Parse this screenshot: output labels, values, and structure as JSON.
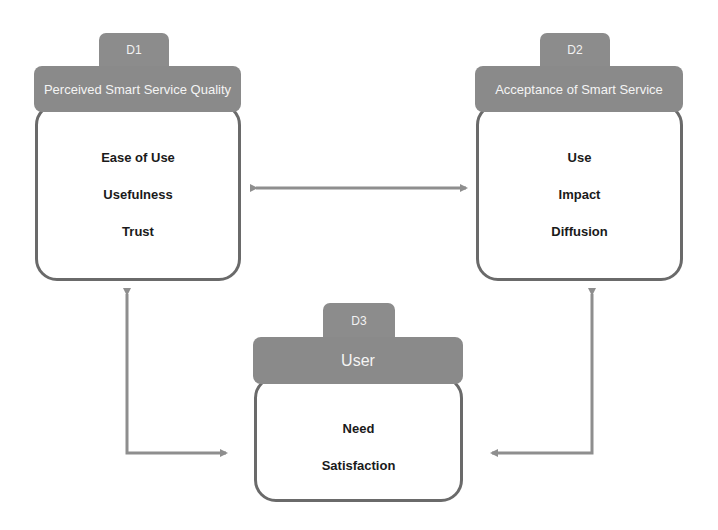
{
  "diagram": {
    "colors": {
      "header_fill": "#8a8a8a",
      "header_text": "#f4f4f4",
      "box_border": "#6a6a6a",
      "arrow": "#8e8e8e"
    },
    "nodes": [
      {
        "id": "D1",
        "tab_label": "D1",
        "title": "Perceived Smart Service Quality",
        "items": [
          "Ease of Use",
          "Usefulness",
          "Trust"
        ]
      },
      {
        "id": "D2",
        "tab_label": "D2",
        "title": "Acceptance of Smart Service",
        "items": [
          "Use",
          "Impact",
          "Diffusion"
        ]
      },
      {
        "id": "D3",
        "tab_label": "D3",
        "title": "User",
        "items": [
          "Need",
          "Satisfaction"
        ]
      }
    ],
    "edges": [
      {
        "from": "D1",
        "to": "D2",
        "type": "bidirectional",
        "shape": "straight-horizontal"
      },
      {
        "from": "D1",
        "to": "D3",
        "type": "bidirectional",
        "shape": "elbow"
      },
      {
        "from": "D2",
        "to": "D3",
        "type": "bidirectional",
        "shape": "elbow"
      }
    ]
  }
}
